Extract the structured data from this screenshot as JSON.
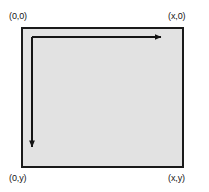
{
  "diagram": {
    "background_color": "#ffffff",
    "rect": {
      "fill_color": "#e2e2e2",
      "stroke_color": "#1a1a1a",
      "stroke_width": 2,
      "x": 21,
      "y": 27,
      "width": 163,
      "height": 141
    },
    "labels": {
      "origin": "(0,0)",
      "top_right": "(x,0)",
      "bottom_left": "(0,y)",
      "bottom_right": "(x,y)"
    },
    "arrows": {
      "color": "#141414",
      "stroke_width": 2,
      "horizontal": {
        "name": "x-axis-arrow",
        "from_x": 32,
        "from_y": 37,
        "to_x": 167,
        "to_y": 37,
        "direction": "right"
      },
      "vertical": {
        "name": "y-axis-arrow",
        "from_x": 32,
        "from_y": 37,
        "to_x": 32,
        "to_y": 153,
        "direction": "down"
      }
    }
  }
}
